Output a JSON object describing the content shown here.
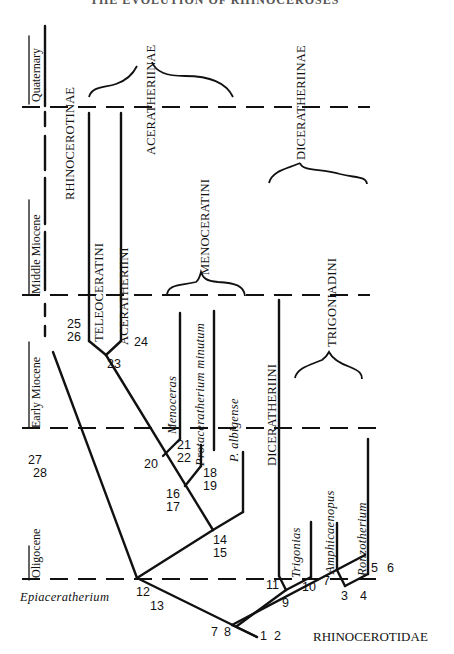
{
  "header": {
    "title_cropped": "THE EVOLUTION OF RHINOCEROSES"
  },
  "time_axis": {
    "epochs": [
      {
        "label": "Quaternary"
      },
      {
        "label": "Middle Miocene"
      },
      {
        "label": "Early Miocene"
      },
      {
        "label": "Oligocene"
      }
    ]
  },
  "clades": {
    "family": "RHINOCEROTIDAE",
    "subfamilies": [
      {
        "label": "RHINOCEROTINAE"
      },
      {
        "label": "ACERATHERIINAE"
      },
      {
        "label": "DICERATHERIINAE"
      }
    ],
    "tribes": [
      {
        "label": "TELEOCERATINI"
      },
      {
        "label": "ACERATHERIINI"
      },
      {
        "label": "MENOCERATINI"
      },
      {
        "label": "DICERATHERIINI"
      },
      {
        "label": "TRIGONIADINI"
      }
    ]
  },
  "taxa": [
    {
      "label": "Epiaceratherium"
    },
    {
      "label": "Menoceras"
    },
    {
      "label": "Protaceratherium minutum"
    },
    {
      "label": "P. albigense"
    },
    {
      "label": "Trigonias"
    },
    {
      "label": "Amphicaenopus"
    },
    {
      "label": "Ronzotherium"
    }
  ],
  "node_numbers": {
    "n1": "1",
    "n2": "2",
    "n3": "3",
    "n4": "4",
    "n5": "5",
    "n6": "6",
    "n7": "7",
    "n8": "8",
    "n7b": "7",
    "n9": "9",
    "n10": "10",
    "n11": "11",
    "n12": "12",
    "n13": "13",
    "n14": "14",
    "n15": "15",
    "n16": "16",
    "n17": "17",
    "n18": "18",
    "n19": "19",
    "n20": "20",
    "n21": "21",
    "n22": "22",
    "n23": "23",
    "n24": "24",
    "n25": "25",
    "n26": "26",
    "n27": "27",
    "n28": "28"
  }
}
